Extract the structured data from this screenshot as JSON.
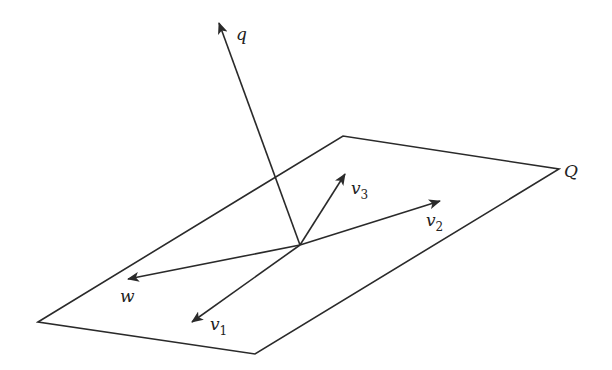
{
  "figure": {
    "plane": {
      "label": "Q",
      "vertices": [
        [
          38,
          322
        ],
        [
          343,
          136
        ],
        [
          559,
          169
        ],
        [
          255,
          354
        ]
      ]
    },
    "origin": [
      300,
      245
    ],
    "vectors": [
      {
        "name": "q",
        "label": "q",
        "sub": "",
        "tip": [
          219,
          23
        ],
        "label_pos": [
          236,
          40
        ]
      },
      {
        "name": "v3",
        "label": "v",
        "sub": "3",
        "tip": [
          345,
          174
        ],
        "label_pos": [
          351,
          194
        ]
      },
      {
        "name": "v2",
        "label": "v",
        "sub": "2",
        "tip": [
          440,
          201
        ],
        "label_pos": [
          426,
          226
        ]
      },
      {
        "name": "w",
        "label": "w",
        "sub": "",
        "tip": [
          128,
          279
        ],
        "label_pos": [
          120,
          302
        ]
      },
      {
        "name": "v1",
        "label": "v",
        "sub": "1",
        "tip": [
          192,
          322
        ],
        "label_pos": [
          210,
          330
        ]
      }
    ],
    "plane_label_pos": [
      564,
      177
    ],
    "colors": {
      "stroke": "#2a2a2a",
      "text": "#222222",
      "background": "#ffffff"
    }
  }
}
